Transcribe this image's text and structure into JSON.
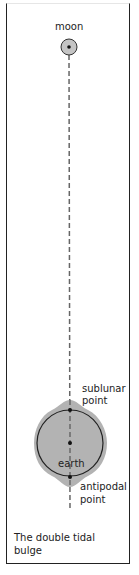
{
  "diagram": {
    "caption": "The double tidal bulge",
    "labels": {
      "moon": "moon",
      "sublunar": "sublunar point",
      "sublunar_line1": "sublunar",
      "sublunar_line2": "point",
      "earth": "earth",
      "antipodal_line1": "antipodal",
      "antipodal_line2": "point"
    },
    "colors": {
      "fill_gray": "#b3b3b3",
      "outline": "#222222",
      "dash": "#555555"
    }
  }
}
